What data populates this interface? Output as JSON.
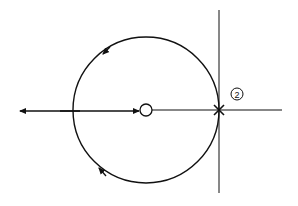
{
  "diagram": {
    "type": "root-locus",
    "colors": {
      "stroke": "#111111",
      "background": "#ffffff"
    },
    "real_axis": {
      "y": 110,
      "x_start": 18,
      "x_end": 282
    },
    "imag_axis": {
      "x": 219,
      "y_start": 10,
      "y_end": 193
    },
    "locus_circle": {
      "cx": 146,
      "cy": 110,
      "r": 73
    },
    "zero": {
      "x": 146,
      "y": 110,
      "r": 6,
      "symbol": "open-circle"
    },
    "pole": {
      "x": 219,
      "y": 110,
      "symbol": "x",
      "multiplicity_label": "2"
    },
    "arrows": [
      {
        "name": "upper-arc-arrow",
        "direction": "counterclockwise"
      },
      {
        "name": "lower-arc-arrow",
        "direction": "clockwise-toward-left"
      },
      {
        "name": "real-axis-left-arrow",
        "direction": "left"
      },
      {
        "name": "real-axis-to-zero-arrow",
        "direction": "right"
      }
    ]
  }
}
